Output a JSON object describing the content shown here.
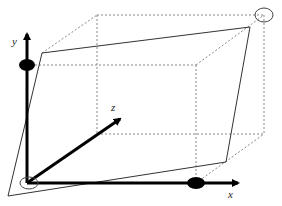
{
  "diagram": {
    "axes": {
      "x_label": "x",
      "y_label": "y",
      "z_label": "z"
    },
    "colors": {
      "axis": "#000000",
      "dashed": "#888888",
      "solid": "#333333",
      "background": "#ffffff"
    },
    "points": {
      "origin": [
        27,
        183
      ],
      "x_tip": [
        240,
        183
      ],
      "y_tip": [
        27,
        32
      ],
      "z_tip": [
        122,
        118
      ],
      "x_marker": [
        196,
        183
      ],
      "y_marker": [
        27,
        65
      ],
      "far_corner_marker": [
        264,
        15
      ]
    },
    "markers": {
      "x_dot": "filled-ellipse",
      "y_dot": "filled-ellipse",
      "origin_circle": "open-ellipse",
      "far_corner_circle": "open-ellipse"
    }
  }
}
